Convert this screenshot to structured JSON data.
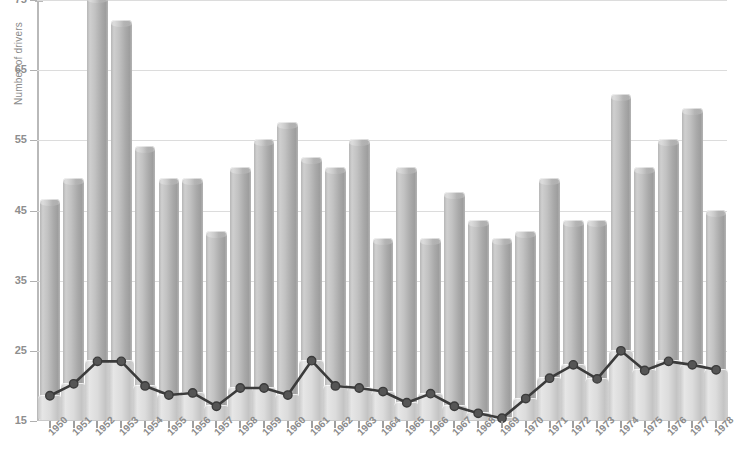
{
  "chart_data": {
    "type": "bar",
    "title": "",
    "subtitle": "",
    "xlabel": "",
    "ylabel": "Number of drivers",
    "ylim": [
      15,
      75
    ],
    "yticks": [
      15,
      25,
      35,
      45,
      55,
      65,
      75
    ],
    "ytick_labels": [
      "15",
      "25",
      "35",
      "45",
      "55",
      "65",
      "75"
    ],
    "grid": true,
    "legend": "none",
    "categories": [
      "1950",
      "1951",
      "1952",
      "1953",
      "1954",
      "1955",
      "1956",
      "1957",
      "1958",
      "1959",
      "1960",
      "1961",
      "1962",
      "1963",
      "1964",
      "1965",
      "1966",
      "1967",
      "1968",
      "1969",
      "1970",
      "1971",
      "1972",
      "1973",
      "1974",
      "1975",
      "1976",
      "1977",
      "1978"
    ],
    "series": [
      {
        "name": "Number of drivers",
        "render": "bar",
        "values": [
          46.5,
          49.5,
          75.5,
          72.0,
          54.0,
          49.5,
          49.5,
          42.0,
          51.0,
          55.0,
          57.5,
          52.5,
          51.0,
          55.0,
          41.0,
          51.0,
          41.0,
          47.5,
          43.5,
          41.0,
          42.0,
          49.5,
          43.5,
          43.5,
          61.5,
          51.0,
          55.0,
          59.5,
          45.0
        ]
      },
      {
        "name": "Lower series",
        "render": "line",
        "values": [
          18.6,
          20.3,
          23.5,
          23.5,
          20.0,
          18.7,
          19.0,
          17.1,
          19.7,
          19.7,
          18.7,
          23.6,
          20.0,
          19.7,
          19.2,
          17.6,
          18.9,
          17.1,
          16.1,
          15.4,
          18.2,
          21.1,
          23.0,
          21.0,
          25.0,
          22.2,
          23.5,
          23.0,
          22.3
        ]
      }
    ]
  },
  "axis": {
    "y_title": "Number of drivers"
  },
  "colors": {
    "bar_fill": "#bdbdbd",
    "bar_shade": "#8f8f8f",
    "line_stroke": "#3b3b3b",
    "grid": "#dcdcdc",
    "axis": "#b9b9b9",
    "tick_text": "#8c8c8c",
    "background": "#ffffff"
  }
}
